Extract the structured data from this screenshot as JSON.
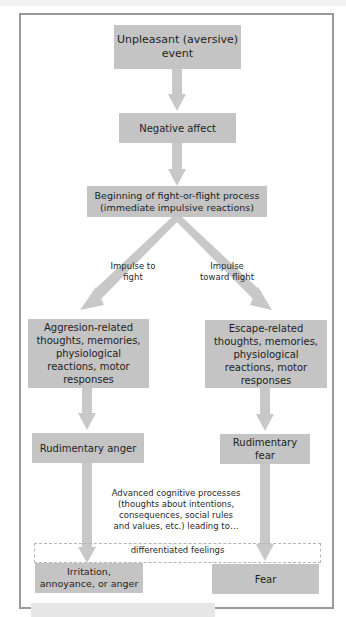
{
  "diagram": {
    "nodes": {
      "unpleasant_event": "Unpleasant (aversive) event",
      "negative_affect": "Negative affect",
      "fight_or_flight": "Beginning of fight-or-flight process (immediate impulsive reactions)",
      "aggression_related": "Aggresion-related thoughts, memories, physiological reactions, motor responses",
      "escape_related": "Escape-related thoughts, memories, physiological reactions, motor responses",
      "rudimentary_anger": "Rudimentary anger",
      "rudimentary_fear": "Rudimentary fear",
      "irritation": "Irritation, annoyance, or anger",
      "fear": "Fear"
    },
    "labels": {
      "impulse_fight": "Impulse to fight",
      "impulse_flight": "Impulse toward flight",
      "advanced_cognitive": "Advanced cognitive processes (thoughts about intentions, consequences, social rules and values, etc.) leading to…",
      "differentiated_feelings": "differentiated feelings"
    },
    "colors": {
      "box_fill": "#c4c4c4",
      "arrow_fill": "#c8c8c8",
      "frame_border": "#9a9a9a"
    }
  }
}
